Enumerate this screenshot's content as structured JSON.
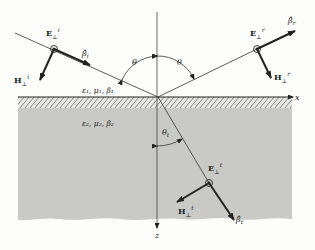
{
  "figure": {
    "axes": {
      "x_label": "x",
      "z_label": "z"
    },
    "media": {
      "medium1": {
        "label": "ε₁, μ₁, β₁"
      },
      "medium2": {
        "label": "ε₂, μ₂, β₂"
      }
    },
    "angles": {
      "incident": "θ",
      "reflected": "θ",
      "transmitted": "θ",
      "transmitted_sub": "t"
    },
    "incident": {
      "E_label": "E",
      "E_sub": "⊥",
      "E_sup": "i",
      "H_label": "H",
      "H_sub": "⊥",
      "H_sup": "i",
      "beta_label": "β̂",
      "beta_sub": "i"
    },
    "reflected": {
      "E_label": "E",
      "E_sub": "⊥",
      "E_sup": "r",
      "H_label": "H",
      "H_sub": "⊥",
      "H_sup": "r",
      "beta_label": "β̂",
      "beta_sub": "r"
    },
    "transmitted": {
      "E_label": "E",
      "E_sub": "⊥",
      "E_sup": "t",
      "H_label": "H",
      "H_sub": "⊥",
      "H_sup": "t",
      "beta_label": "β̂",
      "beta_sub": "t"
    },
    "colors": {
      "medium2_fill": "#c9c9c6",
      "ink": "#222222",
      "background": "#fdfdfb"
    }
  }
}
